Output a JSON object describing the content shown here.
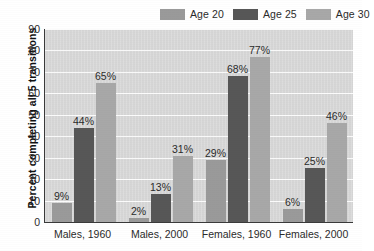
{
  "chart_data": {
    "type": "bar",
    "title": "",
    "xlabel": "",
    "ylabel": "Percent completing all 5 transitions",
    "ylim": [
      0,
      90
    ],
    "ytick_step": 10,
    "yticks": [
      90,
      80,
      70,
      60,
      50,
      40,
      30,
      20,
      10,
      0
    ],
    "grid": "horizontal",
    "legend_position": "top-right",
    "categories": [
      "Males, 1960",
      "Males, 2000",
      "Females, 1960",
      "Females, 2000"
    ],
    "series": [
      {
        "name": "Age 20",
        "color": "#9a9a9a",
        "values": [
          9,
          2,
          29,
          6
        ],
        "labels": [
          "9%",
          "2%",
          "29%",
          "6%"
        ]
      },
      {
        "name": "Age 25",
        "color": "#575757",
        "values": [
          44,
          13,
          68,
          25
        ],
        "labels": [
          "44%",
          "13%",
          "68%",
          "25%"
        ]
      },
      {
        "name": "Age 30",
        "color": "#a8a8a8",
        "values": [
          65,
          31,
          77,
          46
        ],
        "labels": [
          "65%",
          "31%",
          "77%",
          "46%"
        ]
      }
    ]
  },
  "legend": {
    "items": [
      {
        "label": "Age 20"
      },
      {
        "label": "Age 25"
      },
      {
        "label": "Age 30"
      }
    ]
  },
  "axes": {
    "y_title": "Percent completing all 5 transitions"
  }
}
